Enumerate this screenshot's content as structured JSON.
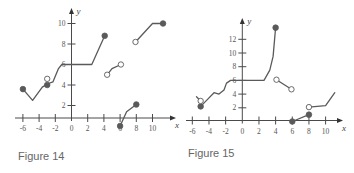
{
  "chart_data": [
    {
      "type": "line",
      "title": "Figure 14",
      "xlabel": "x",
      "ylabel": "y",
      "xlim": [
        -6.5,
        11.8
      ],
      "ylim": [
        0,
        11
      ],
      "x_ticks": [
        -6,
        -4,
        -2,
        0,
        2,
        4,
        6,
        8,
        10
      ],
      "y_ticks": [
        2,
        4,
        6,
        8,
        10
      ],
      "grid": false,
      "segments": [
        {
          "points": [
            [
              -6,
              3.6
            ],
            [
              -4.8,
              2.5
            ],
            [
              -3.6,
              3.8
            ],
            [
              -3,
              4.1
            ],
            [
              -2.3,
              4.3
            ],
            [
              -1.6,
              5.6
            ],
            [
              -1.2,
              6
            ],
            [
              0,
              6
            ],
            [
              2.5,
              6
            ],
            [
              4.1,
              8.8
            ]
          ],
          "start": "filled",
          "end": "filled"
        },
        {
          "points": [
            [
              4.4,
              5.0
            ],
            [
              5.0,
              5.6
            ],
            [
              6.1,
              6.0
            ]
          ],
          "start": "open",
          "end": "open"
        },
        {
          "points": [
            [
              6,
              0
            ],
            [
              6.8,
              1.4
            ],
            [
              8,
              2.1
            ]
          ],
          "start": "filled",
          "end": "filled"
        },
        {
          "points": [
            [
              7.9,
              8.2
            ],
            [
              10,
              10
            ],
            [
              11.3,
              10
            ]
          ],
          "start": "open",
          "end": "filled"
        }
      ],
      "isolated_points": [
        {
          "x": -3,
          "y": 4.0,
          "style": "filled"
        },
        {
          "x": -3,
          "y": 4.6,
          "style": "open"
        }
      ]
    },
    {
      "type": "line",
      "title": "Figure 15",
      "xlabel": "x",
      "ylabel": "y",
      "xlim": [
        -6.5,
        11.5
      ],
      "ylim": [
        0,
        14
      ],
      "x_ticks": [
        -6,
        -4,
        -2,
        0,
        2,
        4,
        6,
        8,
        10
      ],
      "y_ticks": [
        2,
        4,
        6,
        8,
        10,
        12
      ],
      "grid": false,
      "segments": [
        {
          "points": [
            [
              -5,
              2.2
            ],
            [
              -4.2,
              3.2
            ],
            [
              -3.4,
              4.2
            ],
            [
              -2.8,
              4.0
            ],
            [
              -2.2,
              4.6
            ],
            [
              -1.9,
              5.6
            ],
            [
              -1.4,
              6
            ],
            [
              0,
              6
            ],
            [
              2.6,
              6
            ],
            [
              3.3,
              7.5
            ],
            [
              3.7,
              9.5
            ],
            [
              4,
              13.7
            ]
          ],
          "start": "filled",
          "end": "filled"
        },
        {
          "points": [
            [
              4.1,
              6.1
            ],
            [
              5.9,
              4.7
            ]
          ],
          "start": "open",
          "end": "open"
        },
        {
          "points": [
            [
              6,
              0
            ],
            [
              8,
              1.0
            ]
          ],
          "start": "filled",
          "end": "filled"
        },
        {
          "points": [
            [
              8,
              2.1
            ],
            [
              10,
              2.3
            ],
            [
              11.1,
              4.2
            ]
          ],
          "start": "open",
          "end": "none"
        },
        {
          "points": [
            [
              -5,
              3.0
            ],
            [
              -5.5,
              3.6
            ]
          ],
          "start": "open",
          "end": "none"
        }
      ],
      "isolated_points": []
    }
  ],
  "captions": {
    "fig14": "Figure 14",
    "fig15": "Figure 15"
  },
  "axis_labels": {
    "x": "x",
    "y": "y"
  },
  "fig14_ticks": {
    "x": [
      "-6",
      "-4",
      "-2",
      "0",
      "2",
      "4",
      "6",
      "8",
      "10"
    ],
    "y": [
      "2",
      "4",
      "6",
      "8",
      "10"
    ]
  },
  "fig15_ticks": {
    "x": [
      "-6",
      "-4",
      "-2",
      "0",
      "2",
      "4",
      "6",
      "8",
      "10"
    ],
    "y": [
      "2",
      "4",
      "6",
      "8",
      "10",
      "12"
    ]
  }
}
